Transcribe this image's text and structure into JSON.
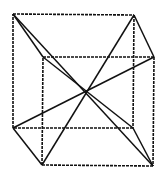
{
  "diagram": {
    "type": "cube-wireframe-with-space-diagonals",
    "vertices": {
      "A": [
        13,
        14
      ],
      "B": [
        134,
        15
      ],
      "C": [
        133,
        128
      ],
      "D": [
        13,
        128
      ],
      "E": [
        43,
        57
      ],
      "F": [
        154,
        57
      ],
      "G": [
        153,
        166
      ],
      "H": [
        42,
        165
      ]
    },
    "center": [
      87,
      89
    ],
    "dashed_edges": [
      [
        "A",
        "B"
      ],
      [
        "B",
        "C"
      ],
      [
        "C",
        "D"
      ],
      [
        "D",
        "A"
      ],
      [
        "E",
        "F"
      ],
      [
        "F",
        "G"
      ],
      [
        "G",
        "H"
      ],
      [
        "H",
        "E"
      ]
    ],
    "solid_edges": [
      [
        "B",
        "F"
      ],
      [
        "D",
        "H"
      ],
      [
        "A",
        "E"
      ],
      [
        "C",
        "G"
      ]
    ],
    "diagonals": [
      [
        "A",
        "G"
      ],
      [
        "B",
        "H"
      ],
      [
        "D",
        "F"
      ],
      [
        "E",
        "C"
      ]
    ],
    "colors": {
      "stroke": "#111111",
      "background": "#ffffff"
    }
  }
}
